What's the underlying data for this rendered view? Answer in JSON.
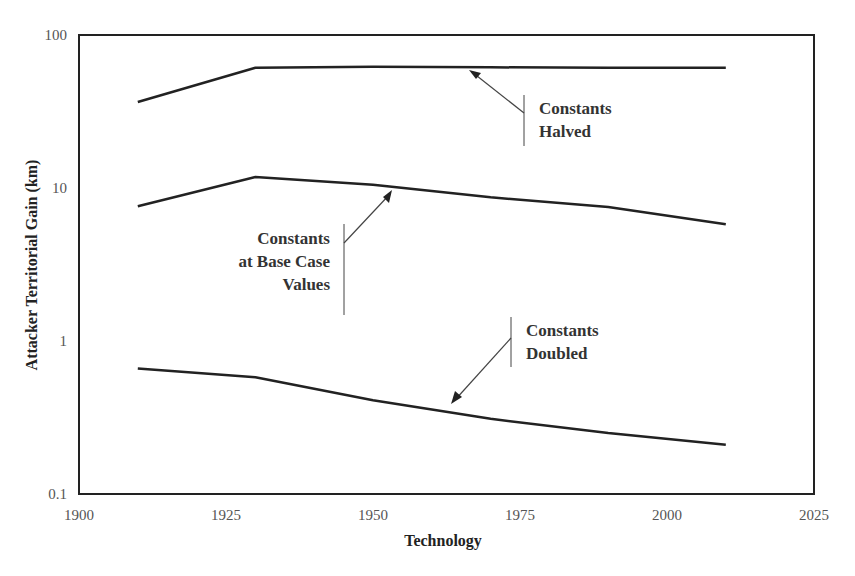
{
  "chart_data": {
    "type": "line",
    "title": "",
    "xlabel": "Technology",
    "ylabel": "Attacker Territorial Gain (km)",
    "xlim": [
      1900,
      2025
    ],
    "ylim": [
      0.1,
      100
    ],
    "yscale": "log",
    "grid": false,
    "legend": "none (inline annotations with arrows)",
    "x_ticks": [
      "1900",
      "1925",
      "1950",
      "1975",
      "2000",
      "2025"
    ],
    "y_ticks": [
      "0.1",
      "1",
      "10",
      "100"
    ],
    "x": [
      1910,
      1930,
      1950,
      1970,
      1990,
      2010
    ],
    "series": [
      {
        "name": "Constants Halved",
        "values": [
          36.5,
          61,
          62,
          61.5,
          61,
          61
        ]
      },
      {
        "name": "Constants at Base Case Values",
        "values": [
          7.6,
          11.8,
          10.5,
          8.7,
          7.5,
          5.8
        ]
      },
      {
        "name": "Constants Doubled",
        "values": [
          0.66,
          0.58,
          0.41,
          0.31,
          0.25,
          0.21
        ]
      }
    ],
    "annotations": [
      {
        "lines": [
          "Constants",
          "Halved"
        ],
        "target_series": "Constants Halved"
      },
      {
        "lines": [
          "Constants",
          "at Base Case",
          "Values"
        ],
        "target_series": "Constants at Base Case Values"
      },
      {
        "lines": [
          "Constants",
          "Doubled"
        ],
        "target_series": "Constants Doubled"
      }
    ]
  },
  "colors": {
    "line": "#222222",
    "frame": "#222222",
    "arrow": "#444444",
    "tick_text": "#555555"
  }
}
